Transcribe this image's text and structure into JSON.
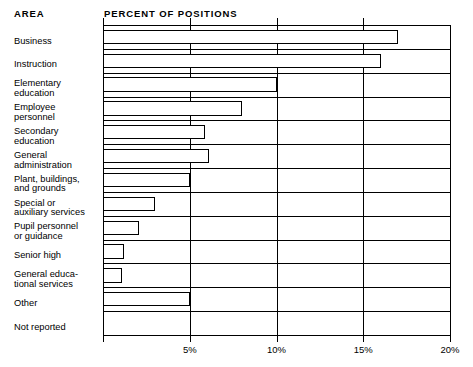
{
  "headers": {
    "area": "AREA",
    "percent": "PERCENT OF POSITIONS"
  },
  "axis": {
    "ticks": [
      {
        "value": 5,
        "label": "5%"
      },
      {
        "value": 10,
        "label": "10%"
      },
      {
        "value": 15,
        "label": "15%"
      },
      {
        "value": 20,
        "label": "20%"
      }
    ],
    "min": 0,
    "max": 20
  },
  "chart_data": {
    "type": "bar",
    "orientation": "horizontal",
    "title": "PERCENT OF POSITIONS",
    "xlabel": "PERCENT OF POSITIONS",
    "ylabel": "AREA",
    "xlim": [
      0,
      20
    ],
    "grid": true,
    "legend": false,
    "tick_labels": [
      "5%",
      "10%",
      "15%",
      "20%"
    ],
    "tick_values": [
      5,
      10,
      15,
      20
    ],
    "categories": [
      "Business",
      "Instruction",
      "Elementary education",
      "Employee personnel",
      "Secondary education",
      "General administration",
      "Plant, buildings, and grounds",
      "Special or auxiliary services",
      "Pupil personnel or guidance",
      "Senior high",
      "General educational services",
      "Other",
      "Not reported"
    ],
    "category_display": [
      "Business",
      "Instruction",
      "Elementary\neducation",
      "Employee\npersonnel",
      "Secondary\neducation",
      "General\nadministration",
      "Plant, buildings,\nand grounds",
      "Special or\nauxiliary services",
      "Pupil personnel\nor guidance",
      "Senior high",
      "General educa-\ntional services",
      "Other",
      "Not reported"
    ],
    "values": [
      17.0,
      16.0,
      10.0,
      8.0,
      5.9,
      6.1,
      5.0,
      3.0,
      2.1,
      1.2,
      1.1,
      5.0,
      0.0
    ],
    "units": "percent"
  }
}
